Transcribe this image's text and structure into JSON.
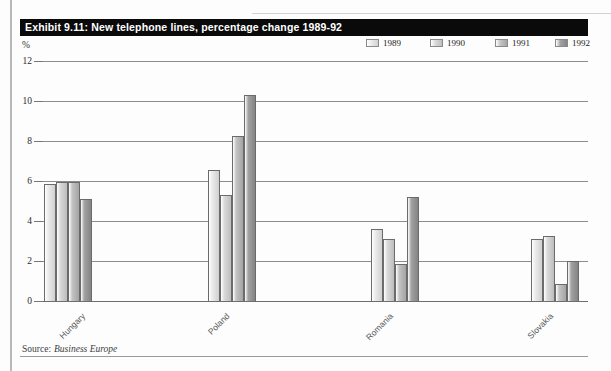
{
  "page": {
    "title": "Exhibit 9.11: New telephone lines, percentage change 1989-92",
    "percent_label": "%",
    "source_prefix": "Source:",
    "source_name": "Business Europe"
  },
  "chart_data": {
    "type": "bar",
    "title": "Exhibit 9.11: New telephone lines, percentage change 1989-92",
    "categories": [
      "Hungary",
      "Poland",
      "Romania",
      "Slovakia"
    ],
    "series": [
      {
        "name": "1989",
        "values": [
          5.85,
          6.55,
          3.6,
          3.1
        ],
        "color": "#ebebeb",
        "shade": "#d2d2d2"
      },
      {
        "name": "1990",
        "values": [
          5.95,
          5.3,
          3.1,
          3.25
        ],
        "color": "#dadada",
        "shade": "#bfbfbf"
      },
      {
        "name": "1991",
        "values": [
          5.95,
          8.25,
          1.85,
          0.85
        ],
        "color": "#c3c3c3",
        "shade": "#a6a6a6"
      },
      {
        "name": "1992",
        "values": [
          5.1,
          10.3,
          5.2,
          2.0
        ],
        "color": "#a2a2a2",
        "shade": "#868686"
      }
    ],
    "xlabel": "",
    "ylabel": "%",
    "ylim": [
      0,
      12
    ],
    "yticks": [
      0,
      2,
      4,
      6,
      8,
      10,
      12
    ],
    "grid": true,
    "legend_position": "top-right",
    "source": "Source: Business Europe"
  }
}
